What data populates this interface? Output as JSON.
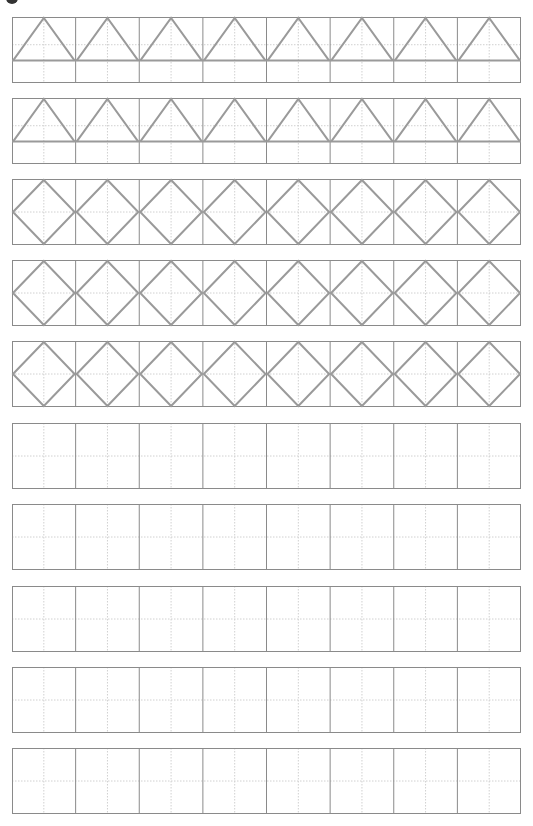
{
  "header": {
    "bullet_icon": "filled-circle",
    "title": ""
  },
  "worksheet": {
    "row_count": 10,
    "cells_per_row": 8,
    "colors": {
      "border": "#8a8a8a",
      "guide": "#d0d0d0",
      "shape": "#9a9a9a"
    },
    "rows": [
      {
        "type": "triangle"
      },
      {
        "type": "triangle"
      },
      {
        "type": "diamond"
      },
      {
        "type": "diamond"
      },
      {
        "type": "diamond"
      },
      {
        "type": "empty"
      },
      {
        "type": "empty"
      },
      {
        "type": "empty"
      },
      {
        "type": "empty"
      },
      {
        "type": "empty"
      }
    ]
  }
}
